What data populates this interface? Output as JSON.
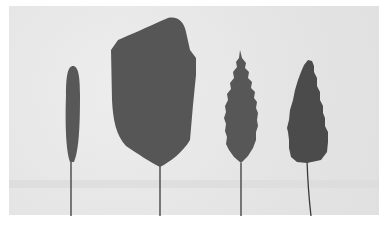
{
  "image": {
    "subject": "Four leaf-shaped specimens mounted on thin wire stems",
    "background_color": "#e6e6e6",
    "border_color": "#ffffff",
    "leaf_color": "#565656",
    "leaf_dark_color": "#4a4a4a",
    "stem_color": "#3a3a3a"
  },
  "specimens": [
    {
      "id": "narrow-elongate",
      "shape": "narrow linear blade, smooth edge"
    },
    {
      "id": "broad-irregular",
      "shape": "large broad irregular blade, smooth edge"
    },
    {
      "id": "lanceolate-serrate",
      "shape": "lanceolate blade, serrated edge"
    },
    {
      "id": "ovate-serrate-dark",
      "shape": "ovate blade, toothed edge, darker"
    }
  ]
}
